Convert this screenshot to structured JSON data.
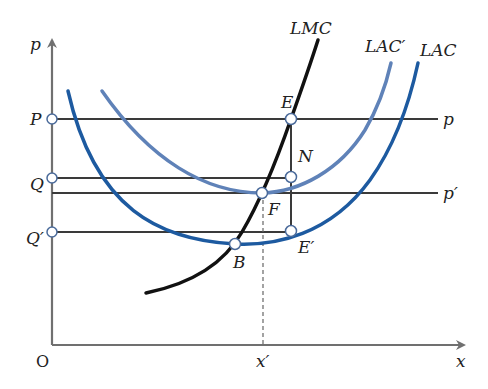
{
  "diagram": {
    "axes": {
      "y_label": "p",
      "x_label": "x",
      "origin_label": "O",
      "x_tick_label": "x′"
    },
    "price_levels": {
      "P_label": "P",
      "Q_label": "Q",
      "Q_prime_label": "Q′",
      "p_line_label": "p",
      "p_prime_line_label": "p′"
    },
    "curves": {
      "lmc_label": "LMC",
      "lac_prime_label": "LAC′",
      "lac_label": "LAC"
    },
    "points": {
      "E": "E",
      "N": "N",
      "F": "F",
      "E_prime": "E′",
      "B": "B"
    },
    "colors": {
      "axis": "#707070",
      "guide_line": "#3a3a3a",
      "lmc": "#111111",
      "lac": "#1d5aa0",
      "lac_prime": "#5f82b8",
      "point_fill": "#ffffff",
      "point_stroke": "#4a6a9a"
    }
  }
}
